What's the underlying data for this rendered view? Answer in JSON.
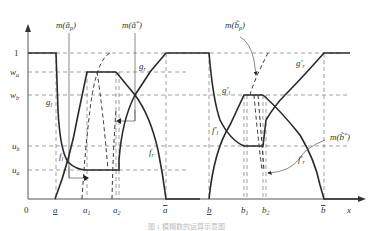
{
  "figure": {
    "y_ticks": {
      "one": "1",
      "wa": "w",
      "wa_sub": "a",
      "wb": "w",
      "wb_sub": "b",
      "ub": "u",
      "ub_sub": "b",
      "ua": "u",
      "ua_sub": "a"
    },
    "x_ticks": {
      "origin": "0",
      "a_low": "a",
      "a1": "a",
      "a1_sub": "1",
      "a2": "a",
      "a2_sub": "2",
      "a_high": "a",
      "b_low": "b",
      "b1": "b",
      "b1_sub": "1",
      "b2": "b",
      "b2_sub": "2",
      "b_high": "b",
      "x_axis": "x"
    },
    "annotations": {
      "m_a_p": "m(ã",
      "m_a_p_sub": "p",
      "m_a_p_close": ")",
      "m_a_star": "m(ã",
      "m_a_star_sup": "*",
      "m_a_star_close": ")",
      "m_b_p": "m(b̃",
      "m_b_p_sub": "p",
      "m_b_p_close": ")",
      "m_b_star": "m(b̃",
      "m_b_star_sup": "*",
      "m_b_star_close": ")"
    },
    "curve_labels": {
      "gl": "g",
      "gl_sub": "l",
      "gr": "g",
      "gr_sub": "r",
      "fl": "f",
      "fl_sub": "l",
      "fr": "f",
      "fr_sub": "r",
      "gl_prime": "g′",
      "gl_prime_sub": "l",
      "gr_prime": "g′",
      "gr_prime_sub": "r",
      "fl_prime": "f′",
      "fl_prime_sub": "l",
      "fr_prime": "f′",
      "fr_prime_sub": "r"
    },
    "caption": "图 1  模糊数的运算示意图"
  }
}
